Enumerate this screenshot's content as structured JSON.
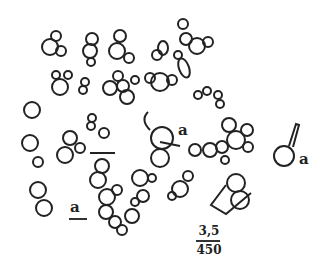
{
  "figure": {
    "labels": [
      {
        "text": "a",
        "x": 178,
        "y": 123
      },
      {
        "text": "a",
        "x": 299,
        "y": 158
      },
      {
        "text": "a",
        "x": 70,
        "y": 204
      }
    ],
    "scale": {
      "numerator": "3,5",
      "denominator": "450"
    },
    "colors": {
      "ink": "#222222",
      "background": "#ffffff"
    }
  }
}
